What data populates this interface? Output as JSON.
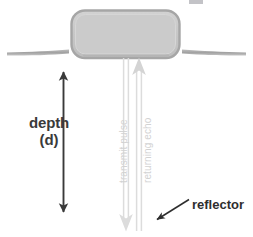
{
  "diagram": {
    "type": "schematic",
    "canvas": {
      "width": 253,
      "height": 237,
      "background": "#ffffff"
    },
    "labels": {
      "depth": "depth",
      "depth_symbol": "(d)",
      "transmit_pulse": "transmit pulse",
      "returning_echo": "returning echo",
      "reflector": "reflector"
    },
    "elements": {
      "transducer": {
        "name": "transducer",
        "shape": "rounded-rectangle",
        "x": 71,
        "y": 10,
        "width": 109,
        "height": 48,
        "corner_radius": 13,
        "fill": "#c9c9c9",
        "stroke": "#a8a8a8"
      },
      "skin_line": {
        "name": "skin-surface-line",
        "stroke": "#a8a8a8",
        "y": 51,
        "x_start": 6,
        "x_end": 247
      },
      "depth_arrow": {
        "name": "depth-double-arrow",
        "direction": "double",
        "x": 63,
        "y_top": 62,
        "y_bottom": 222,
        "stroke": "#3a3a3a"
      },
      "transmit_pulse_arrow": {
        "name": "transmit-pulse-arrow",
        "direction": "down",
        "x": 126,
        "y_top": 58,
        "y_bottom": 230,
        "stroke": "#d8d8d8"
      },
      "returning_echo_arrow": {
        "name": "returning-echo-arrow",
        "direction": "up",
        "x": 139,
        "y_top": 58,
        "y_bottom": 230,
        "stroke": "#d8d8d8"
      },
      "reflector_pointer": {
        "name": "reflector-pointer-arrow",
        "direction": "down-left",
        "x_start": 188,
        "y_start": 199,
        "x_end": 155,
        "y_end": 220,
        "stroke": "#2e2e2e"
      }
    },
    "colors": {
      "ink": "#2e2e2e",
      "label_ink": "#3a3a3a",
      "transducer_fill": "#c9c9c9",
      "transducer_stroke": "#a8a8a8",
      "skin_line": "#a8a8a8",
      "pulse_gray": "#d8d8d8",
      "pulse_label_gray": "#d2d2d2",
      "background": "#ffffff"
    }
  }
}
